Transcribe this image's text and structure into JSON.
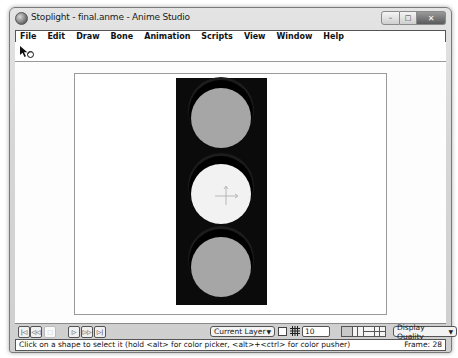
{
  "window": {
    "title": "Stoplight - final.anme - Anime Studio",
    "controls": {
      "minimize": "–",
      "maximize": "□",
      "close": "✕"
    }
  },
  "menubar": {
    "items": [
      {
        "label": "File"
      },
      {
        "label": "Edit"
      },
      {
        "label": "Draw"
      },
      {
        "label": "Bone"
      },
      {
        "label": "Animation"
      },
      {
        "label": "Scripts"
      },
      {
        "label": "View"
      },
      {
        "label": "Window"
      },
      {
        "label": "Help"
      }
    ]
  },
  "toolbar": {
    "active_tool_icon": "select-shape-arrow-icon"
  },
  "canvas": {
    "background": "#ffffff",
    "stoplight": {
      "body_color": "#0b0b0b",
      "lamps": [
        {
          "position": "top",
          "color": "#a6a6a6",
          "state": "off"
        },
        {
          "position": "middle",
          "color": "#f2f2f2",
          "state": "selected"
        },
        {
          "position": "bottom",
          "color": "#a6a6a6",
          "state": "off"
        }
      ]
    }
  },
  "controls": {
    "transport": [
      {
        "name": "rewind-to-start",
        "glyph": "|◁"
      },
      {
        "name": "step-back",
        "glyph": "◁◁"
      },
      {
        "name": "stop",
        "glyph": "□"
      },
      {
        "name": "play",
        "glyph": "▷"
      },
      {
        "name": "step-forward",
        "glyph": "▷▷"
      },
      {
        "name": "forward-to-end",
        "glyph": "▷|"
      }
    ],
    "layer_dropdown": {
      "value": "Current Layer",
      "arrow": "▼"
    },
    "grid_size": "10",
    "quality_dropdown": {
      "value": "Display Quality",
      "arrow": "▼"
    }
  },
  "statusbar": {
    "message": "Click on a shape to select it (hold <alt> for color picker, <alt>+<ctrl> for color pusher)",
    "frame_label": "Frame: 28"
  }
}
